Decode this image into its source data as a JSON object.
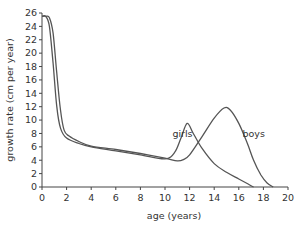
{
  "chart_data": {
    "type": "line",
    "title": "",
    "xlabel": "age (years)",
    "ylabel": "growth rate (cm per year)",
    "xlim": [
      0,
      20
    ],
    "ylim": [
      0,
      26
    ],
    "xticks": [
      0,
      2,
      4,
      6,
      8,
      10,
      12,
      14,
      16,
      18,
      20
    ],
    "yticks": [
      0,
      2,
      4,
      6,
      8,
      10,
      12,
      14,
      16,
      18,
      20,
      22,
      24,
      26
    ],
    "grid": false,
    "legend": "inline labels",
    "series": [
      {
        "name": "girls",
        "label_pos": [
          10.6,
          7.5
        ],
        "x": [
          0,
          0.3,
          0.6,
          0.9,
          1.2,
          1.5,
          2,
          3,
          4,
          6,
          8,
          10,
          10.8,
          11.3,
          11.8,
          12.3,
          13,
          14,
          15,
          16,
          16.8,
          17.2
        ],
        "y": [
          25.5,
          25.5,
          24.0,
          18.5,
          12.0,
          8.8,
          7.3,
          6.5,
          6.0,
          5.4,
          4.8,
          4.2,
          5.2,
          7.3,
          9.5,
          8.0,
          5.8,
          3.5,
          2.2,
          1.2,
          0.4,
          0
        ]
      },
      {
        "name": "boys",
        "label_pos": [
          16.3,
          7.5
        ],
        "x": [
          0,
          0.3,
          0.6,
          0.9,
          1.2,
          1.5,
          1.8,
          2.2,
          3,
          4,
          6,
          8,
          10,
          11,
          11.5,
          12,
          13,
          14,
          14.8,
          15.3,
          16,
          16.7,
          17.2,
          17.8,
          18.3,
          18.8
        ],
        "y": [
          25.5,
          25.5,
          25.3,
          23.0,
          17.0,
          11.5,
          8.5,
          7.6,
          6.8,
          6.1,
          5.6,
          5.0,
          4.3,
          3.9,
          4.1,
          4.8,
          7.5,
          10.3,
          11.8,
          11.5,
          9.5,
          6.5,
          4.0,
          1.8,
          0.6,
          0
        ]
      }
    ]
  }
}
